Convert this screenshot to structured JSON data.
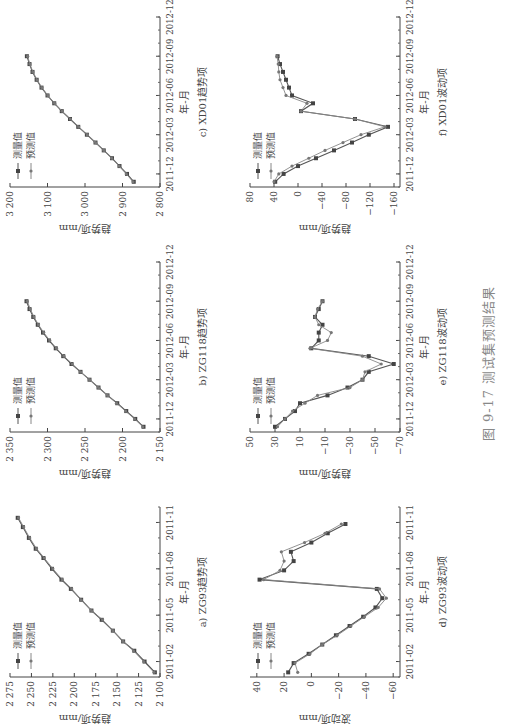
{
  "figure": {
    "caption": "图 9-17   测试集预测结果",
    "legend": {
      "measured": "测量值",
      "predicted": "预测值"
    },
    "xlabel": "年-月"
  },
  "chart_data": [
    {
      "id": "a",
      "type": "line",
      "title": "a) ZG93趋势项",
      "xlabel": "年-月",
      "ylabel": "趋势项/mm",
      "xticks": [
        "2011-02",
        "2011-05",
        "2011-08",
        "2011-11"
      ],
      "yticks": [
        2100,
        2125,
        2150,
        2175,
        2200,
        2225,
        2250,
        2275
      ],
      "ylim": [
        2100,
        2275
      ],
      "xrange": [
        0,
        11
      ],
      "legend": [
        "测量值",
        "预测值"
      ],
      "series": [
        {
          "name": "测量值",
          "x": [
            0.3,
            1,
            1.7,
            2.3,
            3,
            3.7,
            4.3,
            5,
            5.7,
            6.3,
            7,
            7.7,
            8.3,
            9,
            9.7,
            10.3
          ],
          "values": [
            2106,
            2118,
            2130,
            2143,
            2155,
            2168,
            2180,
            2192,
            2204,
            2215,
            2226,
            2236,
            2245,
            2253,
            2260,
            2266
          ]
        },
        {
          "name": "预测值",
          "x": [
            0.3,
            1,
            1.7,
            2.3,
            3,
            3.7,
            4.3,
            5,
            5.7,
            6.3,
            7,
            7.7,
            8.3,
            9,
            9.7,
            10.3
          ],
          "values": [
            2107,
            2119,
            2131,
            2143,
            2155,
            2167,
            2180,
            2192,
            2203,
            2214,
            2225,
            2235,
            2244,
            2252,
            2259,
            2265
          ]
        }
      ]
    },
    {
      "id": "b",
      "type": "line",
      "title": "b) ZG118趋势项",
      "xlabel": "年-月",
      "ylabel": "趋势项/mm",
      "xticks": [
        "2011-12",
        "2012-03",
        "2012-06",
        "2012-09",
        "2012-12"
      ],
      "yticks": [
        2150,
        2200,
        2250,
        2300,
        2350
      ],
      "ylim": [
        2150,
        2350
      ],
      "xrange": [
        -1,
        12
      ],
      "legend": [
        "测量值",
        "预测值"
      ],
      "series": [
        {
          "name": "测量值",
          "x": [
            -0.6,
            0,
            0.6,
            1.2,
            1.8,
            2.4,
            3,
            3.6,
            4.2,
            4.8,
            5.4,
            6,
            6.6,
            7.2,
            7.8,
            8.4,
            9
          ],
          "values": [
            2172,
            2183,
            2195,
            2207,
            2220,
            2232,
            2244,
            2256,
            2268,
            2279,
            2289,
            2298,
            2306,
            2313,
            2319,
            2324,
            2328
          ]
        },
        {
          "name": "预测值",
          "x": [
            -0.6,
            0,
            0.6,
            1.2,
            1.8,
            2.4,
            3,
            3.6,
            4.2,
            4.8,
            5.4,
            6,
            6.6,
            7.2,
            7.8,
            8.4,
            9
          ],
          "values": [
            2173,
            2184,
            2196,
            2208,
            2220,
            2232,
            2244,
            2256,
            2267,
            2278,
            2288,
            2297,
            2305,
            2312,
            2318,
            2323,
            2327
          ]
        }
      ]
    },
    {
      "id": "c",
      "type": "line",
      "title": "c) XD01趋势项",
      "xlabel": "年-月",
      "ylabel": "趋势项/mm",
      "xticks": [
        "2011-12",
        "2012-03",
        "2012-06",
        "2012-09",
        "2012-12"
      ],
      "yticks": [
        2800,
        2900,
        3000,
        3100,
        3200
      ],
      "ylim": [
        2800,
        3200
      ],
      "xrange": [
        -1,
        12
      ],
      "legend": [
        "测量值",
        "预测值"
      ],
      "series": [
        {
          "name": "测量值",
          "x": [
            -0.6,
            0,
            0.6,
            1.2,
            1.8,
            2.4,
            3,
            3.6,
            4.2,
            4.8,
            5.4,
            6,
            6.6,
            7.2,
            7.8,
            8.4,
            9
          ],
          "values": [
            2870,
            2888,
            2908,
            2928,
            2950,
            2972,
            2995,
            3018,
            3040,
            3062,
            3082,
            3100,
            3116,
            3129,
            3140,
            3148,
            3155
          ]
        },
        {
          "name": "预测值",
          "x": [
            -0.6,
            0,
            0.6,
            1.2,
            1.8,
            2.4,
            3,
            3.6,
            4.2,
            4.8,
            5.4,
            6,
            6.6,
            7.2,
            7.8,
            8.4,
            9
          ],
          "values": [
            2872,
            2890,
            2909,
            2929,
            2950,
            2972,
            2994,
            3017,
            3039,
            3061,
            3081,
            3099,
            3115,
            3128,
            3139,
            3147,
            3153
          ]
        }
      ]
    },
    {
      "id": "d",
      "type": "line",
      "title": "d) ZG93波动项",
      "xlabel": "年-月",
      "ylabel": "波动项/mm",
      "xticks": [
        "2011-02",
        "2011-05",
        "2011-08",
        "2011-11"
      ],
      "yticks": [
        -60,
        -40,
        -20,
        0,
        20,
        40
      ],
      "ylim": [
        -65,
        45
      ],
      "xrange": [
        0,
        11
      ],
      "legend": [
        "测量值",
        "预测值"
      ],
      "series": [
        {
          "name": "测量值",
          "x": [
            0.3,
            0.9,
            1.5,
            2.1,
            2.7,
            3.3,
            3.9,
            4.5,
            5.1,
            5.7,
            6.3,
            6.9,
            7.5,
            8.1,
            8.7,
            9.3,
            9.9
          ],
          "values": [
            17,
            13,
            2,
            -8,
            -18,
            -28,
            -38,
            -47,
            -52,
            -48,
            38,
            20,
            13,
            15,
            0,
            -12,
            -25
          ]
        },
        {
          "name": "预测值",
          "x": [
            0.3,
            0.9,
            1.5,
            2.1,
            2.7,
            3.3,
            3.9,
            4.5,
            5.1,
            5.7,
            6.3,
            6.9,
            7.5,
            8.1,
            8.7,
            9.3,
            9.9
          ],
          "values": [
            10,
            12,
            1,
            -8,
            -19,
            -29,
            -39,
            -49,
            -55,
            -50,
            35,
            23,
            20,
            22,
            5,
            -10,
            -22
          ]
        }
      ]
    },
    {
      "id": "e",
      "type": "line",
      "title": "e) ZG118波动项",
      "xlabel": "年-月",
      "ylabel": "趋势项/mm",
      "xticks": [
        "2011-12",
        "2012-03",
        "2012-06",
        "2012-09",
        "2012-12"
      ],
      "yticks": [
        -70,
        -50,
        -30,
        -10,
        10,
        30,
        50
      ],
      "ylim": [
        -70,
        50
      ],
      "xrange": [
        -1,
        12
      ],
      "legend": [
        "测量值",
        "预测值"
      ],
      "series": [
        {
          "name": "测量值",
          "x": [
            -0.6,
            0,
            0.6,
            1.2,
            1.8,
            2.4,
            3,
            3.6,
            4.2,
            4.8,
            5.4,
            6,
            6.6,
            7.2,
            7.8,
            8.4,
            9
          ],
          "values": [
            30,
            22,
            14,
            10,
            -12,
            -28,
            -40,
            -45,
            -65,
            -45,
            1,
            -5,
            -5,
            -8,
            -2,
            -5,
            -8
          ]
        },
        {
          "name": "预测值",
          "x": [
            -0.6,
            0,
            0.6,
            1.2,
            1.8,
            2.4,
            3,
            3.6,
            4.2,
            4.8,
            5.4,
            6,
            6.6,
            7.2,
            7.8,
            8.4,
            9
          ],
          "values": [
            28,
            22,
            16,
            6,
            -4,
            -30,
            -40,
            -42,
            -55,
            -40,
            2,
            -12,
            -15,
            -5,
            -2,
            -4,
            -8
          ]
        }
      ]
    },
    {
      "id": "f",
      "type": "line",
      "title": "f) XD01波动项",
      "xlabel": "年-月",
      "ylabel": "趋势项/mm",
      "xticks": [
        "2011-12",
        "2012-03",
        "2012-06",
        "2012-09",
        "2012-12"
      ],
      "yticks": [
        -160,
        -120,
        -80,
        -40,
        0,
        40,
        80
      ],
      "ylim": [
        -170,
        80
      ],
      "xrange": [
        -1,
        12
      ],
      "legend": [
        "测量值",
        "预测值"
      ],
      "series": [
        {
          "name": "测量值",
          "x": [
            -0.6,
            0,
            0.6,
            1.2,
            1.8,
            2.4,
            3,
            3.6,
            4.2,
            4.8,
            5.4,
            6,
            6.6,
            7.2,
            7.8,
            8.4,
            9
          ],
          "values": [
            38,
            24,
            0,
            -30,
            -60,
            -90,
            -118,
            -150,
            -95,
            -5,
            -25,
            10,
            15,
            20,
            25,
            30,
            34
          ]
        },
        {
          "name": "预测值",
          "x": [
            -0.6,
            0,
            0.6,
            1.2,
            1.8,
            2.4,
            3,
            3.6,
            4.2,
            4.8,
            5.4,
            6,
            6.6,
            7.2,
            7.8,
            8.4,
            9
          ],
          "values": [
            40,
            32,
            10,
            -18,
            -45,
            -75,
            -105,
            -145,
            -95,
            -5,
            -15,
            20,
            25,
            30,
            32,
            33,
            35
          ]
        }
      ]
    }
  ]
}
